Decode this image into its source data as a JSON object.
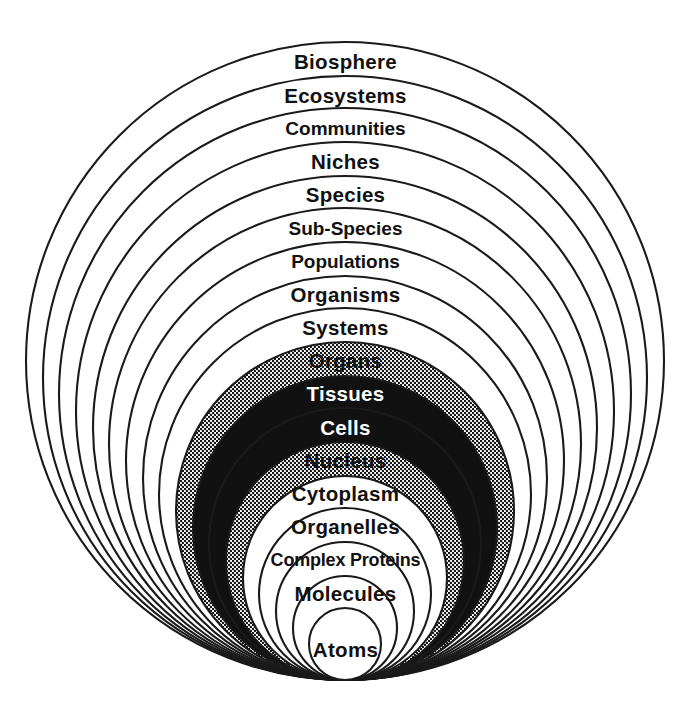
{
  "figure": {
    "background_color": "#ffffff",
    "stroke_color": "#1a1a1a",
    "fill_white": "#ffffff",
    "fill_gray": "#8d8d8d",
    "fill_black": "#111111",
    "text_dark": "#111111",
    "text_light": "#ffffff",
    "tangent_point": {
      "x": 345,
      "y": 680
    },
    "outer_circle": {
      "cx": 345,
      "cy": 361,
      "r": 319
    }
  },
  "chart_data": {
    "type": "diagram",
    "subtype": "concentric-circles-tangent-bottom",
    "count": 18,
    "order": "outermost-to-innermost",
    "levels": [
      {
        "index": 1,
        "label": "Biosphere",
        "radius": 319,
        "fill": "white",
        "text_color": "dark",
        "label_y": 52
      },
      {
        "index": 2,
        "label": "Ecosystems",
        "radius": 302,
        "fill": "white",
        "text_color": "dark",
        "label_y": 86
      },
      {
        "index": 3,
        "label": "Communities",
        "radius": 286,
        "fill": "white",
        "text_color": "dark",
        "label_y": 119
      },
      {
        "index": 4,
        "label": "Niches",
        "radius": 269,
        "fill": "white",
        "text_color": "dark",
        "label_y": 152
      },
      {
        "index": 5,
        "label": "Species",
        "radius": 252,
        "fill": "white",
        "text_color": "dark",
        "label_y": 185
      },
      {
        "index": 6,
        "label": "Sub-Species",
        "radius": 236,
        "fill": "white",
        "text_color": "dark",
        "label_y": 219
      },
      {
        "index": 7,
        "label": "Populations",
        "radius": 219,
        "fill": "white",
        "text_color": "dark",
        "label_y": 252
      },
      {
        "index": 8,
        "label": "Organisms",
        "radius": 202,
        "fill": "white",
        "text_color": "dark",
        "label_y": 285
      },
      {
        "index": 9,
        "label": "Systems",
        "radius": 186,
        "fill": "white",
        "text_color": "dark",
        "label_y": 318
      },
      {
        "index": 10,
        "label": "Organs",
        "radius": 169,
        "fill": "gray",
        "text_color": "dark",
        "label_y": 351
      },
      {
        "index": 11,
        "label": "Tissues",
        "radius": 152,
        "fill": "black",
        "text_color": "light",
        "label_y": 384
      },
      {
        "index": 12,
        "label": "Cells",
        "radius": 136,
        "fill": "black",
        "text_color": "light",
        "label_y": 418
      },
      {
        "index": 13,
        "label": "Nucleus",
        "radius": 119,
        "fill": "gray",
        "text_color": "dark",
        "label_y": 451
      },
      {
        "index": 14,
        "label": "Cytoplasm",
        "radius": 102,
        "fill": "white",
        "text_color": "dark",
        "label_y": 484
      },
      {
        "index": 15,
        "label": "Organelles",
        "radius": 86,
        "fill": "white",
        "text_color": "dark",
        "label_y": 517
      },
      {
        "index": 16,
        "label": "Complex Proteins",
        "radius": 69,
        "fill": "white",
        "text_color": "dark",
        "label_y": 551
      },
      {
        "index": 17,
        "label": "Molecules",
        "radius": 52,
        "fill": "white",
        "text_color": "dark",
        "label_y": 584
      },
      {
        "index": 18,
        "label": "Atoms",
        "radius": 36,
        "fill": "white",
        "text_color": "dark",
        "label_y": 640
      }
    ]
  }
}
